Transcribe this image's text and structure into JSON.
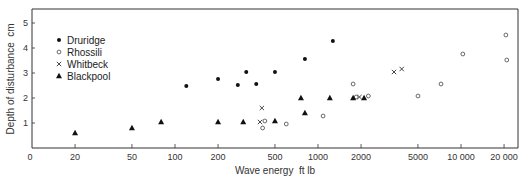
{
  "chart_data": {
    "type": "scatter",
    "title": "",
    "xlabel": "Wave energy  ft lb",
    "ylabel": "Depth of disturbance  cm",
    "x_scale": "log",
    "xlim": [
      10,
      25000
    ],
    "ylim": [
      0,
      5.6
    ],
    "x_ticks": [
      {
        "value": 20,
        "label": "20"
      },
      {
        "value": 50,
        "label": "50"
      },
      {
        "value": 100,
        "label": "100"
      },
      {
        "value": 200,
        "label": "200"
      },
      {
        "value": 500,
        "label": "500"
      },
      {
        "value": 1000,
        "label": "1000"
      },
      {
        "value": 2000,
        "label": "2000"
      },
      {
        "value": 5000,
        "label": "5000"
      },
      {
        "value": 10000,
        "label": "10 000"
      },
      {
        "value": 20000,
        "label": "20 000"
      }
    ],
    "x_origin_label": "0",
    "y_ticks": [
      {
        "value": 1,
        "label": "1"
      },
      {
        "value": 2,
        "label": "2"
      },
      {
        "value": 3,
        "label": "3"
      },
      {
        "value": 4,
        "label": "4"
      },
      {
        "value": 5,
        "label": "5"
      }
    ],
    "grid": false,
    "legend_position": "upper left (inside)",
    "series": [
      {
        "name": "Druridge",
        "marker": "filled-circle",
        "points": [
          [
            120,
            2.48
          ],
          [
            200,
            2.76
          ],
          [
            275,
            2.52
          ],
          [
            315,
            3.04
          ],
          [
            370,
            2.56
          ],
          [
            500,
            3.04
          ],
          [
            810,
            3.56
          ],
          [
            1270,
            4.28
          ]
        ]
      },
      {
        "name": "Rhossili",
        "marker": "open-circle",
        "points": [
          [
            410,
            0.8
          ],
          [
            425,
            1.08
          ],
          [
            600,
            0.96
          ],
          [
            1085,
            1.28
          ],
          [
            1760,
            2.56
          ],
          [
            1850,
            2.04
          ],
          [
            2250,
            2.08
          ],
          [
            5000,
            2.08
          ],
          [
            7250,
            2.56
          ],
          [
            10300,
            3.76
          ],
          [
            20600,
            4.52
          ],
          [
            20900,
            3.52
          ]
        ]
      },
      {
        "name": "Whitbeck",
        "marker": "cross",
        "points": [
          [
            393,
            1.04
          ],
          [
            405,
            1.6
          ],
          [
            1950,
            2.04
          ],
          [
            3400,
            3.04
          ],
          [
            3850,
            3.16
          ]
        ]
      },
      {
        "name": "Blackpool",
        "marker": "filled-triangle",
        "points": [
          [
            20,
            0.6
          ],
          [
            50,
            0.8
          ],
          [
            80,
            1.04
          ],
          [
            200,
            1.04
          ],
          [
            300,
            1.04
          ],
          [
            500,
            1.08
          ],
          [
            760,
            2.0
          ],
          [
            810,
            1.4
          ],
          [
            1210,
            2.0
          ],
          [
            1760,
            2.0
          ],
          [
            2100,
            2.0
          ]
        ]
      }
    ]
  }
}
